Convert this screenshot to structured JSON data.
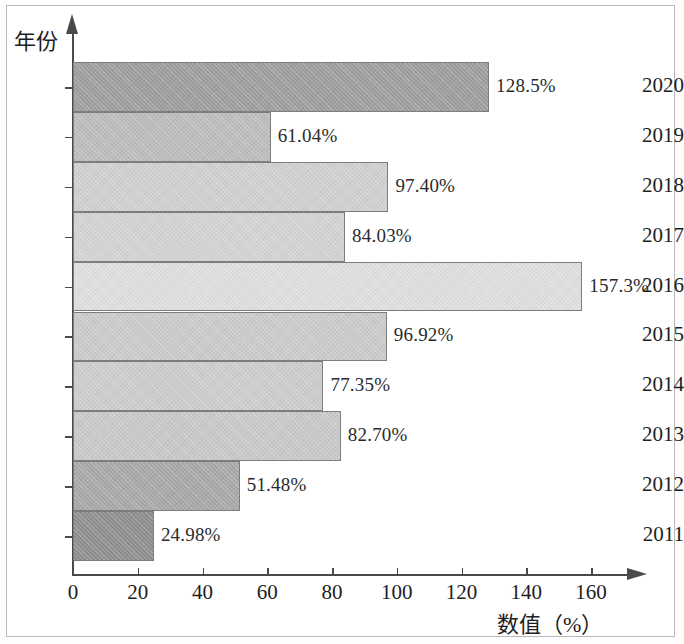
{
  "figure": {
    "y_axis_title": "年份",
    "x_axis_title": "数值（%）"
  },
  "chart_data": {
    "type": "bar",
    "orientation": "horizontal",
    "title": "",
    "xlabel": "数值（%）",
    "ylabel": "年份",
    "xlim": [
      0,
      173
    ],
    "xticks": [
      0,
      20,
      40,
      60,
      80,
      100,
      120,
      140,
      160
    ],
    "xtick_labels": [
      "0",
      "20",
      "40",
      "60",
      "80",
      "100",
      "120",
      "140",
      "160"
    ],
    "grid": false,
    "legend": null,
    "categories": [
      "2020",
      "2019",
      "2018",
      "2017",
      "2016",
      "2015",
      "2014",
      "2013",
      "2012",
      "2011"
    ],
    "values": [
      128.5,
      61.04,
      97.4,
      84.03,
      157.3,
      96.92,
      77.35,
      82.7,
      51.48,
      24.98
    ],
    "data_labels": [
      "128.5%",
      "61.04%",
      "97.40%",
      "84.03%",
      "157.3%",
      "96.92%",
      "77.35%",
      "82.70%",
      "51.48%",
      "24.98%"
    ],
    "bar_colors": [
      "#9e9e9e",
      "#bcbcbc",
      "#cfcfcf",
      "#d2d2d2",
      "#dedede",
      "#cacaca",
      "#cccccc",
      "#c8c8c8",
      "#a8a8a8",
      "#8f8f8f"
    ]
  }
}
